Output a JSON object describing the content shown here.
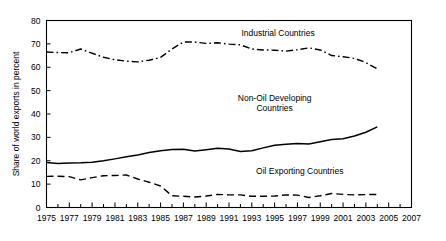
{
  "chart_data": {
    "type": "line",
    "title": "",
    "xlabel": "",
    "ylabel": "Share of world exports in percent",
    "xlim": [
      1975,
      2007
    ],
    "ylim": [
      0,
      80
    ],
    "grid": false,
    "legend_position": "inline-annotations",
    "y_ticks": [
      "0",
      "10",
      "20",
      "30",
      "40",
      "50",
      "60",
      "70",
      "80"
    ],
    "y_tick_values": [
      0,
      10,
      20,
      30,
      40,
      50,
      60,
      70,
      80
    ],
    "x_ticks": [
      "1975",
      "1977",
      "1979",
      "1981",
      "1983",
      "1985",
      "1987",
      "1989",
      "1991",
      "1993",
      "1995",
      "1997",
      "1999",
      "2001",
      "2003",
      "2005",
      "2007"
    ],
    "x_tick_values": [
      1975,
      1977,
      1979,
      1981,
      1983,
      1985,
      1987,
      1989,
      1991,
      1993,
      1995,
      1997,
      1999,
      2001,
      2003,
      2005,
      2007
    ],
    "x_minor_step": 1,
    "x": [
      1975,
      1976,
      1977,
      1978,
      1979,
      1980,
      1981,
      1982,
      1983,
      1984,
      1985,
      1986,
      1987,
      1988,
      1989,
      1990,
      1991,
      1992,
      1993,
      1994,
      1995,
      1996,
      1997,
      1998,
      1999,
      2000,
      2001,
      2002,
      2003,
      2004
    ],
    "series": [
      {
        "name": "Industrial Countries",
        "style": "dash-dot",
        "color": "#000000",
        "label_x": 1995.3,
        "label_y": 73.5,
        "values": [
          66.5,
          66.3,
          66.2,
          67.8,
          66.0,
          64.3,
          63.2,
          62.6,
          62.3,
          63.0,
          64.2,
          67.8,
          70.8,
          70.8,
          70.2,
          70.5,
          69.9,
          69.6,
          67.8,
          67.4,
          67.3,
          66.9,
          67.5,
          68.3,
          67.4,
          65.0,
          64.5,
          63.8,
          62.0,
          59.3
        ]
      },
      {
        "name": "Non-Oil Developing Countries",
        "style": "solid",
        "color": "#000000",
        "label_x": 1995.0,
        "label_y": 45.5,
        "values": [
          19.2,
          18.8,
          19.0,
          19.1,
          19.4,
          20.0,
          20.8,
          21.7,
          22.5,
          23.5,
          24.3,
          24.8,
          24.9,
          24.2,
          24.7,
          25.3,
          25.0,
          24.0,
          24.3,
          25.5,
          26.6,
          27.1,
          27.4,
          27.2,
          28.1,
          29.1,
          29.4,
          30.6,
          32.2,
          34.5
        ]
      },
      {
        "name": "Oil Exporting Countries",
        "style": "dashed",
        "color": "#000000",
        "label_x": 1997.2,
        "label_y": 14.2,
        "values": [
          13.3,
          13.4,
          13.2,
          11.8,
          12.8,
          13.6,
          13.7,
          13.9,
          12.2,
          10.8,
          9.2,
          5.0,
          4.8,
          4.5,
          4.9,
          5.6,
          5.4,
          5.4,
          4.8,
          4.8,
          4.9,
          5.4,
          5.3,
          4.3,
          5.0,
          6.0,
          5.6,
          5.4,
          5.5,
          5.6
        ]
      }
    ]
  }
}
